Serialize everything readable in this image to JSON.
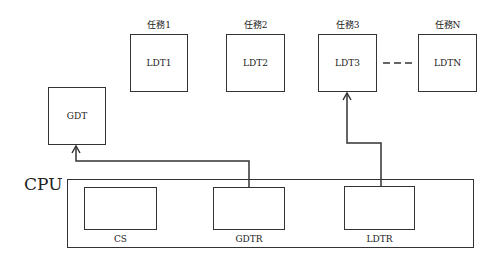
{
  "tasks": [
    {
      "title": "任務1",
      "table": "LDT1"
    },
    {
      "title": "任務2",
      "table": "LDT2"
    },
    {
      "title": "任務3",
      "table": "LDT3"
    },
    {
      "title": "任務N",
      "table": "LDTN"
    }
  ],
  "gdt": {
    "label": "GDT"
  },
  "cpu": {
    "label": "CPU",
    "registers": [
      {
        "label": "CS"
      },
      {
        "label": "GDTR"
      },
      {
        "label": "LDTR"
      }
    ]
  },
  "connections": [
    {
      "from": "GDTR",
      "to": "GDT"
    },
    {
      "from": "LDTR",
      "to": "LDT3"
    }
  ],
  "colors": {
    "stroke": "#333333",
    "background": "#ffffff"
  }
}
